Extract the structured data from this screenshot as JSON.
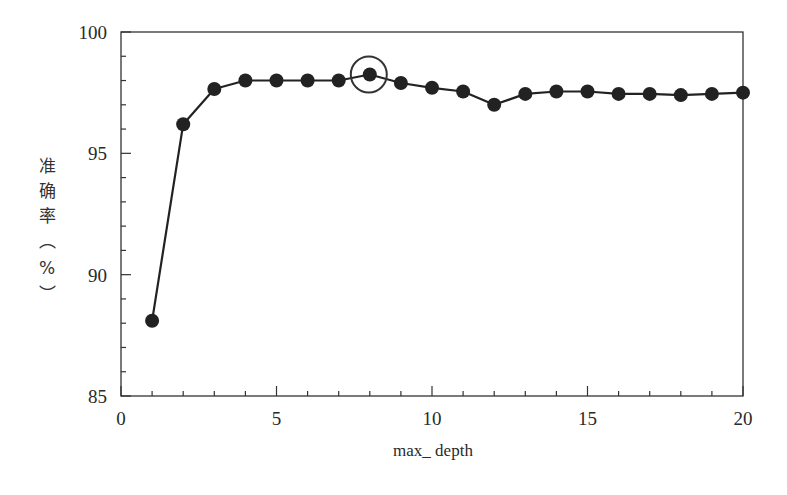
{
  "chart_data": {
    "type": "line",
    "title": "",
    "xlabel": "max_ depth",
    "ylabel": "准确率（%）",
    "ylabel_chars": [
      "准",
      "确",
      "率",
      "︵",
      "%",
      "︶"
    ],
    "x": [
      1,
      2,
      3,
      4,
      5,
      6,
      7,
      8,
      9,
      10,
      11,
      12,
      13,
      14,
      15,
      16,
      17,
      18,
      19,
      20
    ],
    "series": [
      {
        "name": "准确率",
        "values": [
          88.1,
          96.2,
          97.65,
          98.0,
          98.0,
          98.0,
          98.0,
          98.25,
          97.9,
          97.7,
          97.55,
          97.0,
          97.45,
          97.55,
          97.55,
          97.45,
          97.45,
          97.4,
          97.45,
          97.5
        ],
        "marker": "filled-circle",
        "color": "#222222"
      }
    ],
    "xlim": [
      0,
      20
    ],
    "ylim": [
      85,
      100
    ],
    "x_major_ticks": [
      0,
      5,
      10,
      15,
      20
    ],
    "x_tick_labels": [
      "0",
      "5",
      "10",
      "15",
      "20"
    ],
    "x_minor_step": 1,
    "y_major_ticks": [
      85,
      90,
      95,
      100
    ],
    "y_tick_labels": [
      "85",
      "90",
      "95",
      "100"
    ],
    "y_minor_step": 1,
    "grid": false,
    "legend": null,
    "annotations": [
      {
        "type": "circle-highlight",
        "x": 8,
        "y": 98.25,
        "note": "best max_depth"
      }
    ]
  }
}
